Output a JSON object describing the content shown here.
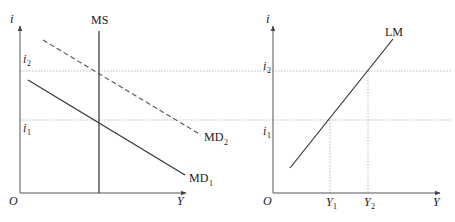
{
  "left_panel": {
    "y_axis_label": "i",
    "x_axis_label": "Y",
    "origin_label": "O",
    "i2_label": "i",
    "i2_sub": "2",
    "i1_label": "i",
    "i1_sub": "1",
    "ms_label": "MS",
    "md1_label": "MD",
    "md1_sub": "1",
    "md2_label": "MD",
    "md2_sub": "2"
  },
  "right_panel": {
    "y_axis_label": "i",
    "x_axis_label": "Y",
    "origin_label": "O",
    "i2_label": "i",
    "i2_sub": "2",
    "i1_label": "i",
    "i1_sub": "1",
    "lm_label": "LM",
    "y1_label": "Y",
    "y1_sub": "1",
    "y2_label": "Y",
    "y2_sub": "2"
  },
  "colors": {
    "line": "#333333",
    "guide": "#aaaaaa"
  }
}
